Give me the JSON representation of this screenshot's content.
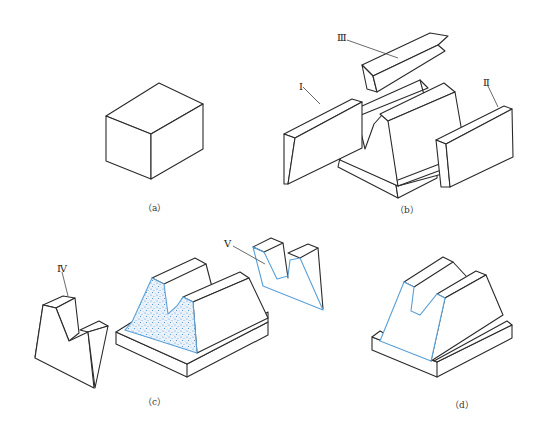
{
  "figure": {
    "colors": {
      "line": "#2a2a2a",
      "highlight": "#5aa0d8",
      "background": "#ffffff"
    },
    "panels": [
      {
        "id": "a",
        "caption": "（a）",
        "content": "rectangular prism (base block)"
      },
      {
        "id": "b",
        "caption": "（b）",
        "content": "block with removed pieces",
        "pieces": [
          {
            "label": "Ⅰ",
            "name": "left slanted slab"
          },
          {
            "label": "Ⅱ",
            "name": "right slanted slab"
          },
          {
            "label": "Ⅲ",
            "name": "V-groove wedge"
          }
        ]
      },
      {
        "id": "c",
        "caption": "（c）",
        "content": "cut block with highlighted section",
        "pieces": [
          {
            "label": "Ⅳ",
            "name": "front V-notched piece"
          },
          {
            "label": "Ⅴ",
            "name": "section face piece (blue outline)"
          }
        ]
      },
      {
        "id": "d",
        "caption": "（d）",
        "content": "final V-block with blue outlined face"
      }
    ]
  },
  "labels": {
    "I": "Ⅰ",
    "II": "Ⅱ",
    "III": "Ⅲ",
    "IV": "Ⅳ",
    "V": "Ⅴ"
  },
  "captions": {
    "a": "（a）",
    "b": "（b）",
    "c": "（c）",
    "d": "（d）"
  }
}
